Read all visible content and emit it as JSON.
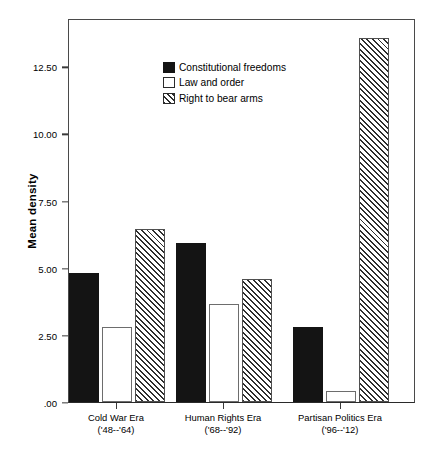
{
  "chart_data": {
    "type": "bar",
    "title": "",
    "xlabel": "",
    "ylabel": "Mean density",
    "ylim": [
      0,
      14.3
    ],
    "grid": false,
    "legend_position": "top-left",
    "categories": [
      "Cold War Era",
      "Human Rights Era",
      "Partisan Politics Era"
    ],
    "category_sublabels": [
      "('48--'64)",
      "('68--'92)",
      "('96--'12)"
    ],
    "ytick_labels": [
      "12.50",
      "10.00",
      "7.50",
      "5.00",
      "2.50",
      ".00"
    ],
    "ytick_values": [
      12.5,
      10.0,
      7.5,
      5.0,
      2.5,
      0.0
    ],
    "series": [
      {
        "name": "Constitutional freedoms",
        "style": "solid",
        "values": [
          4.81,
          5.91,
          2.79
        ]
      },
      {
        "name": "Law and order",
        "style": "open",
        "values": [
          2.79,
          3.66,
          0.42
        ]
      },
      {
        "name": "Right to bear arms",
        "style": "hatch",
        "values": [
          6.45,
          4.58,
          13.55
        ]
      }
    ]
  },
  "legend": {
    "items": [
      {
        "label": "Constitutional freedoms",
        "style": "solid"
      },
      {
        "label": "Law and order",
        "style": "open"
      },
      {
        "label": "Right to bear arms",
        "style": "hatch"
      }
    ]
  },
  "colors": {
    "solid_fill": "#141414",
    "open_fill": "#ffffff",
    "hatch_line": "#2e2e2e",
    "frame": "#4a4a4a",
    "text": "#000000"
  }
}
